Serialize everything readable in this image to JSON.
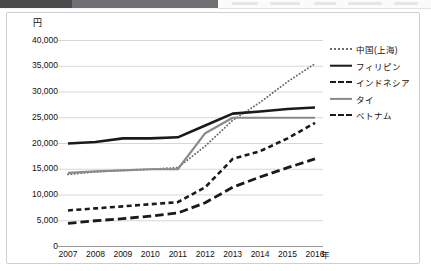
{
  "toolbar": {
    "visible": true
  },
  "chart_data": {
    "type": "line",
    "title": "",
    "subtitle": "",
    "xlabel": "年",
    "ylabel": "円",
    "x": [
      2007,
      2008,
      2009,
      2010,
      2011,
      2012,
      2013,
      2014,
      2015,
      2016
    ],
    "categories": [
      "2007",
      "2008",
      "2009",
      "2010",
      "2011",
      "2012",
      "2013",
      "2014",
      "2015",
      "2016"
    ],
    "ylim": [
      0,
      40000
    ],
    "yticks": [
      0,
      5000,
      10000,
      15000,
      20000,
      25000,
      30000,
      35000,
      40000
    ],
    "ytick_labels": [
      "0",
      "5,000",
      "10,000",
      "15,000",
      "20,000",
      "25,000",
      "30,000",
      "35,000",
      "40,000"
    ],
    "grid": true,
    "legend_position": "right",
    "series": [
      {
        "name": "中国(上海)",
        "style": "dotted",
        "color": "#6d6d6d",
        "values": [
          14000,
          14500,
          14800,
          15000,
          15300,
          19500,
          24500,
          28000,
          32000,
          35500
        ]
      },
      {
        "name": "フィリピン",
        "style": "solid-bold",
        "color": "#1a1a1a",
        "values": [
          20000,
          20300,
          21000,
          21000,
          21200,
          23500,
          25800,
          26200,
          26700,
          27000
        ]
      },
      {
        "name": "インドネシア",
        "style": "dashed",
        "color": "#1a1a1a",
        "values": [
          7000,
          7400,
          7800,
          8200,
          8600,
          11500,
          17000,
          18500,
          21000,
          24000
        ]
      },
      {
        "name": "タイ",
        "style": "solid-gray",
        "color": "#8a8a8a",
        "values": [
          14300,
          14600,
          14800,
          15000,
          15000,
          22000,
          25000,
          25000,
          25000,
          25000
        ]
      },
      {
        "name": "ベトナム",
        "style": "long-dashed",
        "color": "#1a1a1a",
        "values": [
          4500,
          5000,
          5400,
          5900,
          6500,
          8500,
          11500,
          13500,
          15300,
          17000
        ]
      }
    ]
  }
}
